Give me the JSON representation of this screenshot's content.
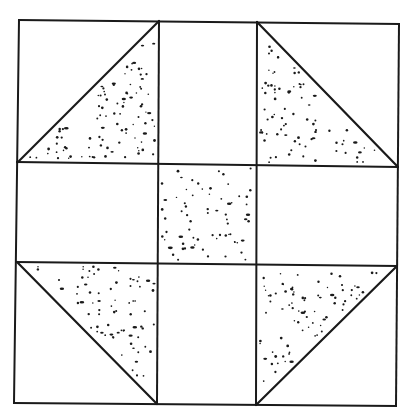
{
  "diagram": {
    "colors": {
      "background": "#ffffff",
      "line": "#1a1a1a",
      "stipple": "#1a1a1a"
    },
    "grid": {
      "corners": {
        "top_left": [
          19,
          20
        ],
        "top_right": [
          399,
          24
        ],
        "bottom_left": [
          14,
          403
        ],
        "bottom_right": [
          396,
          406
        ]
      },
      "vertical_lines": [
        {
          "name": "left-edge",
          "top": [
            19,
            20
          ],
          "bottom": [
            14,
            403
          ]
        },
        {
          "name": "inner-vertical-1",
          "top": [
            159,
            21
          ],
          "bottom": [
            157,
            404
          ]
        },
        {
          "name": "inner-vertical-2",
          "top": [
            257,
            22
          ],
          "bottom": [
            256,
            405
          ]
        },
        {
          "name": "right-edge",
          "top": [
            399,
            24
          ],
          "bottom": [
            396,
            406
          ]
        }
      ],
      "horizontal_lines": [
        {
          "name": "top-edge",
          "left": [
            19,
            20
          ],
          "right": [
            399,
            24
          ]
        },
        {
          "name": "inner-horizontal-1",
          "left": [
            17,
            162
          ],
          "right": [
            398,
            167
          ]
        },
        {
          "name": "inner-horizontal-2",
          "left": [
            16,
            262
          ],
          "right": [
            397,
            266
          ]
        },
        {
          "name": "bottom-edge",
          "left": [
            14,
            403
          ],
          "right": [
            396,
            406
          ]
        }
      ]
    },
    "shaded_regions": [
      {
        "name": "triangle-top-left",
        "shape": "triangle",
        "points": [
          [
            159,
            21
          ],
          [
            159,
            163
          ],
          [
            18,
            162
          ]
        ],
        "hypotenuse": [
          [
            18,
            162
          ],
          [
            159,
            21
          ]
        ],
        "stipple_count": 95
      },
      {
        "name": "triangle-top-right",
        "shape": "triangle",
        "points": [
          [
            257,
            22
          ],
          [
            257,
            166
          ],
          [
            398,
            167
          ]
        ],
        "hypotenuse": [
          [
            257,
            22
          ],
          [
            398,
            167
          ]
        ],
        "stipple_count": 80
      },
      {
        "name": "center-square",
        "shape": "rect",
        "points": [
          [
            159,
            164
          ],
          [
            257,
            165
          ],
          [
            257,
            264
          ],
          [
            158,
            263
          ]
        ],
        "stipple_count": 70
      },
      {
        "name": "triangle-bottom-left",
        "shape": "triangle",
        "points": [
          [
            17,
            262
          ],
          [
            158,
            263
          ],
          [
            157,
            404
          ]
        ],
        "hypotenuse": [
          [
            17,
            262
          ],
          [
            157,
            404
          ]
        ],
        "stipple_count": 75
      },
      {
        "name": "triangle-bottom-right",
        "shape": "triangle",
        "points": [
          [
            256,
            265
          ],
          [
            397,
            266
          ],
          [
            256,
            405
          ]
        ],
        "hypotenuse": [
          [
            397,
            266
          ],
          [
            256,
            405
          ]
        ],
        "stipple_count": 80
      }
    ],
    "stipple_seed": 7
  }
}
